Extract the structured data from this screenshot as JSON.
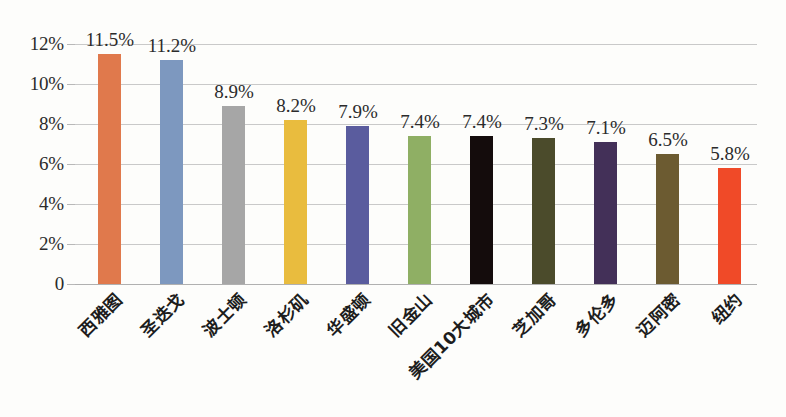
{
  "chart_data": {
    "type": "bar",
    "title": "",
    "subtitle": "",
    "xlabel": "",
    "ylabel": "",
    "grid": true,
    "legend": "none",
    "ylim": [
      0,
      12
    ],
    "yticks": [
      "0",
      "2%",
      "4%",
      "6%",
      "8%",
      "10%",
      "12%"
    ],
    "ytick_values": [
      0,
      2,
      4,
      6,
      8,
      10,
      12
    ],
    "categories": [
      "西雅图",
      "圣迭戈",
      "波士顿",
      "洛杉矶",
      "华盛顿",
      "旧金山",
      "美国10大城市",
      "芝加哥",
      "多伦多",
      "迈阿密",
      "纽约"
    ],
    "values": [
      11.5,
      11.2,
      8.9,
      8.2,
      7.9,
      7.4,
      7.4,
      7.3,
      7.1,
      6.5,
      5.8
    ],
    "value_labels": [
      "11.5%",
      "11.2%",
      "8.9%",
      "8.2%",
      "7.9%",
      "7.4%",
      "7.4%",
      "7.3%",
      "7.1%",
      "6.5%",
      "5.8%"
    ],
    "bar_colors": [
      "#E0794C",
      "#7D98BF",
      "#A6A6A6",
      "#E9BC3E",
      "#5A5C9E",
      "#8FAF64",
      "#140C0C",
      "#4B4B2B",
      "#433058",
      "#6C5B31",
      "#F04A28"
    ],
    "gridline_color": "#C9C9C9",
    "background_color": "#FDFDFB",
    "text_color": "#2B2B2B"
  }
}
